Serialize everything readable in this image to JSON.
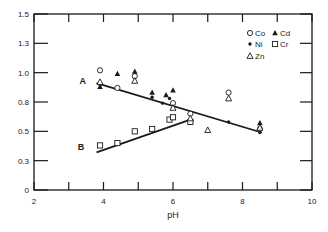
{
  "chart_data": {
    "type": "scatter",
    "title": "",
    "xlabel": "pH",
    "ylabel": "",
    "xlim": [
      2,
      10
    ],
    "ylim": [
      0,
      1.5
    ],
    "x_ticks": [
      2,
      4,
      6,
      8,
      10
    ],
    "x_minor_ticks": [
      3,
      5,
      7,
      9
    ],
    "y_ticks": [
      0,
      0.25,
      0.5,
      0.75,
      1.0,
      1.25,
      1.5
    ],
    "y_tick_labels": [
      "0",
      "0.3",
      "0.5",
      "0.8",
      "1.0",
      "1.3",
      "1.5"
    ],
    "grid": false,
    "legend_position": "upper right (inside)",
    "legend": [
      {
        "symbol": "open-circle",
        "label": "Co"
      },
      {
        "symbol": "filled-triangle",
        "label": "Cd"
      },
      {
        "symbol": "filled-dot",
        "label": "Ni"
      },
      {
        "symbol": "open-square",
        "label": "Cr"
      },
      {
        "symbol": "open-triangle",
        "label": "Zn"
      }
    ],
    "lines": [
      {
        "name": "A",
        "x": [
          3.8,
          8.55
        ],
        "y": [
          0.91,
          0.49
        ]
      },
      {
        "name": "B",
        "x": [
          3.8,
          6.5
        ],
        "y": [
          0.32,
          0.6
        ]
      }
    ],
    "annotations": [
      {
        "text": "A",
        "x": 3.4,
        "y": 0.93
      },
      {
        "text": "B",
        "x": 3.35,
        "y": 0.37
      }
    ],
    "series": [
      {
        "name": "Co",
        "symbol": "open-circle",
        "x": [
          3.9,
          4.4,
          4.9,
          6.0,
          6.5,
          7.6,
          8.5
        ],
        "y": [
          1.02,
          0.87,
          0.97,
          0.74,
          0.65,
          0.83,
          0.52
        ]
      },
      {
        "name": "Cd",
        "symbol": "filled-triangle",
        "x": [
          3.9,
          4.4,
          4.9,
          5.4,
          5.8,
          6.0,
          8.5
        ],
        "y": [
          0.88,
          0.99,
          1.01,
          0.83,
          0.81,
          0.85,
          0.57
        ]
      },
      {
        "name": "Ni",
        "symbol": "filled-dot",
        "x": [
          3.9,
          5.4,
          5.7,
          5.9,
          7.6,
          8.5
        ],
        "y": [
          0.9,
          0.79,
          0.74,
          0.78,
          0.58,
          0.49
        ]
      },
      {
        "name": "Cr",
        "symbol": "open-square",
        "x": [
          3.9,
          4.4,
          4.9,
          5.4,
          5.9,
          6.0,
          6.5
        ],
        "y": [
          0.38,
          0.4,
          0.5,
          0.52,
          0.6,
          0.62,
          0.58
        ]
      },
      {
        "name": "Zn",
        "symbol": "open-triangle",
        "x": [
          3.9,
          4.9,
          6.0,
          6.5,
          7.0,
          7.6,
          8.5
        ],
        "y": [
          0.92,
          0.93,
          0.7,
          0.61,
          0.51,
          0.78,
          0.53
        ]
      }
    ]
  }
}
